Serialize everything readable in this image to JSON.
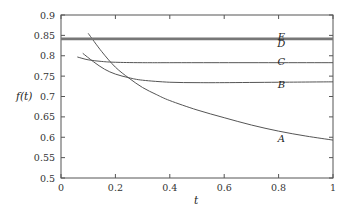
{
  "chart_data": {
    "type": "line",
    "title": "",
    "xlabel": "t",
    "ylabel": "f(t)",
    "xlim": [
      0,
      1
    ],
    "ylim": [
      0.5,
      0.9
    ],
    "grid": false,
    "legend": "inline labels at right",
    "x_ticks": [
      "0",
      "0.2",
      "0.4",
      "0.6",
      "0.8",
      "1"
    ],
    "y_ticks": [
      "0.5",
      "0.55",
      "0.6",
      "0.65",
      "0.7",
      "0.75",
      "0.8",
      "0.85",
      "0.9"
    ],
    "series": [
      {
        "name": "A",
        "label_at": [
          0.81,
          0.598
        ],
        "x": [
          0.1,
          0.15,
          0.2,
          0.25,
          0.3,
          0.35,
          0.4,
          0.5,
          0.6,
          0.7,
          0.8,
          0.9,
          1.0
        ],
        "y": [
          0.855,
          0.81,
          0.772,
          0.745,
          0.722,
          0.705,
          0.69,
          0.667,
          0.648,
          0.63,
          0.615,
          0.603,
          0.593
        ]
      },
      {
        "name": "B",
        "label_at": [
          0.81,
          0.729
        ],
        "x": [
          0.08,
          0.12,
          0.16,
          0.2,
          0.25,
          0.3,
          0.4,
          0.5,
          0.6,
          0.8,
          1.0
        ],
        "y": [
          0.806,
          0.785,
          0.767,
          0.755,
          0.746,
          0.74,
          0.735,
          0.734,
          0.734,
          0.735,
          0.736
        ]
      },
      {
        "name": "C",
        "label_at": [
          0.81,
          0.786
        ],
        "x": [
          0.06,
          0.1,
          0.15,
          0.2,
          0.3,
          0.5,
          1.0
        ],
        "y": [
          0.797,
          0.79,
          0.786,
          0.784,
          0.783,
          0.783,
          0.783
        ]
      },
      {
        "name": "D",
        "label_at": [
          0.81,
          0.83
        ],
        "x": [
          0.0,
          1.0
        ],
        "y": [
          0.84,
          0.84
        ]
      },
      {
        "name": "E",
        "label_at": [
          0.81,
          0.848
        ],
        "x": [
          0.0,
          1.0
        ],
        "y": [
          0.843,
          0.843
        ]
      }
    ]
  }
}
